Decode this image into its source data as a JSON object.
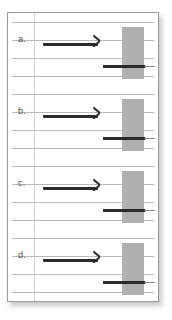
{
  "figure": {
    "kind": "ruled-paper-diagram",
    "background_color": "#ffffff",
    "page_color": "#ffffff",
    "page_border_color": "#9a9a9a",
    "rule_line_color": "#b9b9b9",
    "margin_rule_color": "#cfcfcf",
    "arrow_color": "#2b2b2b",
    "block_color": "#b0b0b0",
    "bar_color": "#2b2b2b",
    "bar_tail_color": "#8c8c8c"
  },
  "rows": [
    {
      "label": "a.",
      "arrow_name": "right-arrow-a",
      "block_name": "gray-block-a",
      "bar_name": "dark-bar-a"
    },
    {
      "label": "b.",
      "arrow_name": "right-arrow-b",
      "block_name": "gray-block-b",
      "bar_name": "dark-bar-b"
    },
    {
      "label": "c.",
      "arrow_name": "right-arrow-c",
      "block_name": "gray-block-c",
      "bar_name": "dark-bar-c"
    },
    {
      "label": "d.",
      "arrow_name": "right-arrow-d",
      "block_name": "gray-block-d",
      "bar_name": "dark-bar-d"
    }
  ],
  "rule_lines_y": [
    22,
    40,
    57,
    75,
    92,
    110,
    127,
    145,
    162,
    180,
    197,
    215,
    232,
    250,
    267,
    285
  ],
  "margin_rule_x": 34
}
